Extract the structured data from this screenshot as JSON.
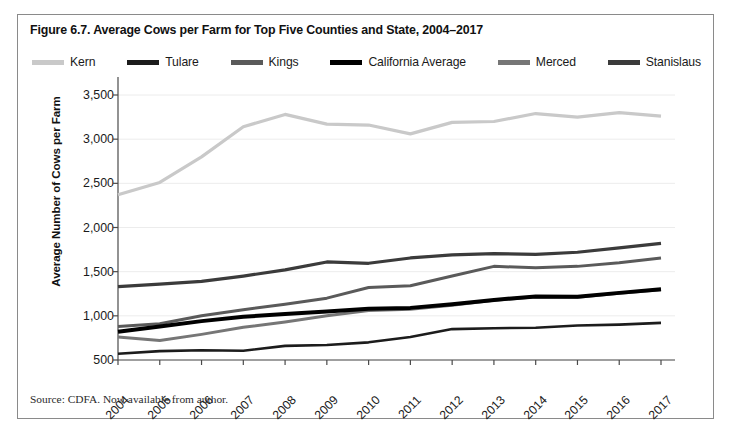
{
  "figure": {
    "title": "Figure 6.7. Average Cows per Farm for Top Five Counties and State, 2004–2017",
    "source": "Source: CDFA. Now available from author."
  },
  "chart_data": {
    "type": "line",
    "title": "Figure 6.7. Average Cows per Farm for Top Five Counties and State, 2004–2017",
    "xlabel": "",
    "ylabel": "Average Number of Cows per Farm",
    "x": [
      "2004",
      "2005",
      "2006",
      "2007",
      "2008",
      "2009",
      "2010",
      "2011",
      "2012",
      "2013",
      "2014",
      "2015",
      "2016",
      "2017"
    ],
    "categories": [
      "2004",
      "2005",
      "2006",
      "2007",
      "2008",
      "2009",
      "2010",
      "2011",
      "2012",
      "2013",
      "2014",
      "2015",
      "2016",
      "2017"
    ],
    "ylim": [
      500,
      3500
    ],
    "yticks": [
      500,
      1000,
      1500,
      2000,
      2500,
      3000,
      3500
    ],
    "ytick_labels": [
      "500",
      "1,000",
      "1,500",
      "2,000",
      "2,500",
      "3,000",
      "3,500"
    ],
    "grid": true,
    "legend_position": "top",
    "series": [
      {
        "name": "Kern",
        "color": "#c9c9c9",
        "width": 3.2,
        "values": [
          2370,
          2510,
          2800,
          3140,
          3280,
          3170,
          3160,
          3060,
          3190,
          3200,
          3290,
          3250,
          3300,
          3260
        ]
      },
      {
        "name": "Tulare",
        "color": "#1c1c1c",
        "width": 2.6,
        "values": [
          570,
          600,
          610,
          605,
          660,
          670,
          700,
          760,
          850,
          860,
          865,
          890,
          900,
          920
        ]
      },
      {
        "name": "Kings",
        "color": "#5a5a5a",
        "width": 3.0,
        "values": [
          880,
          910,
          1000,
          1070,
          1130,
          1200,
          1320,
          1340,
          1450,
          1560,
          1545,
          1560,
          1600,
          1655
        ]
      },
      {
        "name": "California Average",
        "color": "#000000",
        "width": 4.0,
        "values": [
          820,
          880,
          940,
          990,
          1020,
          1050,
          1080,
          1090,
          1130,
          1180,
          1220,
          1215,
          1260,
          1300
        ]
      },
      {
        "name": "Merced",
        "color": "#767676",
        "width": 3.0,
        "values": [
          760,
          720,
          790,
          870,
          930,
          1000,
          1060,
          1075,
          1120,
          1175,
          1215,
          1210,
          1255,
          1295
        ]
      },
      {
        "name": "Stanislaus",
        "color": "#3b3b3b",
        "width": 3.2,
        "values": [
          1330,
          1360,
          1390,
          1450,
          1520,
          1610,
          1595,
          1655,
          1690,
          1705,
          1695,
          1720,
          1770,
          1820
        ]
      }
    ]
  },
  "legend": {
    "items": [
      {
        "label": "Kern",
        "color": "#c9c9c9"
      },
      {
        "label": "Tulare",
        "color": "#1c1c1c"
      },
      {
        "label": "Kings",
        "color": "#5a5a5a"
      },
      {
        "label": "California Average",
        "color": "#000000"
      },
      {
        "label": "Merced",
        "color": "#767676"
      },
      {
        "label": "Stanislaus",
        "color": "#3b3b3b"
      }
    ]
  }
}
